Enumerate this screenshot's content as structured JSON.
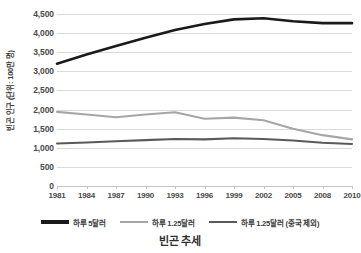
{
  "chart_data": {
    "type": "line",
    "title": "빈곤 추세",
    "xlabel": "",
    "ylabel": "빈곤 인구 (단위: 100만 명)",
    "categories": [
      "1981",
      "1984",
      "1987",
      "1990",
      "1993",
      "1996",
      "1999",
      "2002",
      "2005",
      "2008",
      "2010"
    ],
    "x": [
      1981,
      1984,
      1987,
      1990,
      1993,
      1996,
      1999,
      2002,
      2005,
      2008,
      2010
    ],
    "ylim": [
      0,
      4500
    ],
    "ytick_values": [
      0,
      500,
      1000,
      1500,
      2000,
      2500,
      3000,
      3500,
      4000,
      4500
    ],
    "ytick_labels": [
      "0",
      "500",
      "1,000",
      "1,500",
      "2,000",
      "2,500",
      "3,000",
      "3,500",
      "4,000",
      "4,500"
    ],
    "grid": true,
    "legend_position": "bottom",
    "series": [
      {
        "name": "하루 5달러",
        "color": "#1a1a1a",
        "values": [
          3200,
          3440,
          3660,
          3880,
          4080,
          4240,
          4360,
          4390,
          4310,
          4260,
          4260
        ]
      },
      {
        "name": "하루 1.25달러",
        "color": "#a6a6a6",
        "values": [
          1940,
          1870,
          1800,
          1870,
          1930,
          1760,
          1790,
          1720,
          1500,
          1330,
          1220
        ]
      },
      {
        "name": "하루 1.25달러 (중국 제외)",
        "color": "#5a5a5a",
        "values": [
          1110,
          1140,
          1170,
          1200,
          1230,
          1220,
          1250,
          1230,
          1190,
          1130,
          1100
        ]
      }
    ]
  }
}
